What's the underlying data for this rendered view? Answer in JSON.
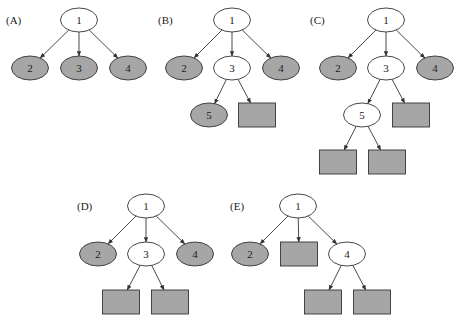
{
  "colors": {
    "shaded_fill": "#a6a6a6",
    "open_fill": "#ffffff",
    "stroke": "#333333",
    "edge": "#333333"
  },
  "node_size": {
    "ellipse_rx": 18.5,
    "ellipse_ry": 12,
    "rect_w": 37,
    "rect_h": 24
  },
  "panels": [
    {
      "id": "A",
      "label": "(A)",
      "label_pos": [
        6,
        20
      ],
      "nodes": [
        {
          "id": "1",
          "label": "1",
          "shape": "ellipse",
          "shaded": false,
          "cx": 79,
          "cy": 20
        },
        {
          "id": "2",
          "label": "2",
          "shape": "ellipse",
          "shaded": true,
          "cx": 30,
          "cy": 68
        },
        {
          "id": "3",
          "label": "3",
          "shape": "ellipse",
          "shaded": true,
          "cx": 79,
          "cy": 68
        },
        {
          "id": "4",
          "label": "4",
          "shape": "ellipse",
          "shaded": true,
          "cx": 128,
          "cy": 68
        }
      ],
      "edges": [
        [
          "1",
          "2"
        ],
        [
          "1",
          "3"
        ],
        [
          "1",
          "4"
        ]
      ]
    },
    {
      "id": "B",
      "label": "(B)",
      "label_pos": [
        158,
        20
      ],
      "nodes": [
        {
          "id": "1",
          "label": "1",
          "shape": "ellipse",
          "shaded": false,
          "cx": 232,
          "cy": 20
        },
        {
          "id": "2",
          "label": "2",
          "shape": "ellipse",
          "shaded": true,
          "cx": 184,
          "cy": 68
        },
        {
          "id": "3",
          "label": "3",
          "shape": "ellipse",
          "shaded": false,
          "cx": 232,
          "cy": 68
        },
        {
          "id": "4",
          "label": "4",
          "shape": "ellipse",
          "shaded": true,
          "cx": 281,
          "cy": 68
        },
        {
          "id": "5",
          "label": "5",
          "shape": "ellipse",
          "shaded": true,
          "cx": 209,
          "cy": 115
        },
        {
          "id": "r1",
          "label": "",
          "shape": "rect",
          "shaded": true,
          "cx": 257,
          "cy": 115
        }
      ],
      "edges": [
        [
          "1",
          "2"
        ],
        [
          "1",
          "3"
        ],
        [
          "1",
          "4"
        ],
        [
          "3",
          "5"
        ],
        [
          "3",
          "r1"
        ]
      ]
    },
    {
      "id": "C",
      "label": "(C)",
      "label_pos": [
        310,
        20
      ],
      "nodes": [
        {
          "id": "1",
          "label": "1",
          "shape": "ellipse",
          "shaded": false,
          "cx": 386,
          "cy": 20
        },
        {
          "id": "2",
          "label": "2",
          "shape": "ellipse",
          "shaded": true,
          "cx": 338,
          "cy": 68
        },
        {
          "id": "3",
          "label": "3",
          "shape": "ellipse",
          "shaded": false,
          "cx": 386,
          "cy": 68
        },
        {
          "id": "4",
          "label": "4",
          "shape": "ellipse",
          "shaded": true,
          "cx": 435,
          "cy": 68
        },
        {
          "id": "5",
          "label": "5",
          "shape": "ellipse",
          "shaded": false,
          "cx": 362,
          "cy": 115
        },
        {
          "id": "r1",
          "label": "",
          "shape": "rect",
          "shaded": true,
          "cx": 411,
          "cy": 115
        },
        {
          "id": "r2",
          "label": "",
          "shape": "rect",
          "shaded": true,
          "cx": 338,
          "cy": 162
        },
        {
          "id": "r3",
          "label": "",
          "shape": "rect",
          "shaded": true,
          "cx": 387,
          "cy": 162
        }
      ],
      "edges": [
        [
          "1",
          "2"
        ],
        [
          "1",
          "3"
        ],
        [
          "1",
          "4"
        ],
        [
          "3",
          "5"
        ],
        [
          "3",
          "r1"
        ],
        [
          "5",
          "r2"
        ],
        [
          "5",
          "r3"
        ]
      ]
    },
    {
      "id": "D",
      "label": "(D)",
      "label_pos": [
        77,
        206
      ],
      "nodes": [
        {
          "id": "1",
          "label": "1",
          "shape": "ellipse",
          "shaded": false,
          "cx": 146,
          "cy": 206
        },
        {
          "id": "2",
          "label": "2",
          "shape": "ellipse",
          "shaded": true,
          "cx": 98,
          "cy": 254
        },
        {
          "id": "3",
          "label": "3",
          "shape": "ellipse",
          "shaded": false,
          "cx": 146,
          "cy": 254
        },
        {
          "id": "4",
          "label": "4",
          "shape": "ellipse",
          "shaded": true,
          "cx": 195,
          "cy": 254
        },
        {
          "id": "r1",
          "label": "",
          "shape": "rect",
          "shaded": true,
          "cx": 121,
          "cy": 302
        },
        {
          "id": "r2",
          "label": "",
          "shape": "rect",
          "shaded": true,
          "cx": 170,
          "cy": 302
        }
      ],
      "edges": [
        [
          "1",
          "2"
        ],
        [
          "1",
          "3"
        ],
        [
          "1",
          "4"
        ],
        [
          "3",
          "r1"
        ],
        [
          "3",
          "r2"
        ]
      ]
    },
    {
      "id": "E",
      "label": "(E)",
      "label_pos": [
        230,
        206
      ],
      "nodes": [
        {
          "id": "1",
          "label": "1",
          "shape": "ellipse",
          "shaded": false,
          "cx": 298,
          "cy": 206
        },
        {
          "id": "2",
          "label": "2",
          "shape": "ellipse",
          "shaded": true,
          "cx": 250,
          "cy": 254
        },
        {
          "id": "r1",
          "label": "",
          "shape": "rect",
          "shaded": true,
          "cx": 299,
          "cy": 254
        },
        {
          "id": "4",
          "label": "4",
          "shape": "ellipse",
          "shaded": false,
          "cx": 347,
          "cy": 254
        },
        {
          "id": "r2",
          "label": "",
          "shape": "rect",
          "shaded": true,
          "cx": 323,
          "cy": 302
        },
        {
          "id": "r3",
          "label": "",
          "shape": "rect",
          "shaded": true,
          "cx": 372,
          "cy": 302
        }
      ],
      "edges": [
        [
          "1",
          "2"
        ],
        [
          "1",
          "r1"
        ],
        [
          "1",
          "4"
        ],
        [
          "4",
          "r2"
        ],
        [
          "4",
          "r3"
        ]
      ]
    }
  ]
}
